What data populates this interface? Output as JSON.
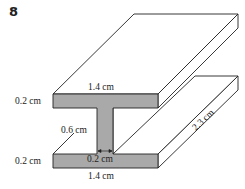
{
  "question_number": "8",
  "labels": {
    "top_flange_width": "1.4 cm",
    "top_flange_thickness": "0.2 cm",
    "web_height": "0.6 cm",
    "web_width": "0.2 cm",
    "bottom_flange_thickness": "0.2 cm",
    "bottom_flange_width": "1.4 cm",
    "length": "2.3 cm"
  },
  "colors": {
    "face_fill": "#a9a9a9",
    "line": "#222222",
    "background": "#ffffff"
  }
}
